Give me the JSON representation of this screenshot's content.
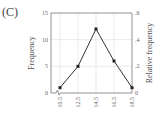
{
  "panel_label": "(C)",
  "chart_data": {
    "type": "line",
    "title": "",
    "xlabel": "",
    "ylabel": "Frequency",
    "ylabel_right": "Relative frequency",
    "x": [
      10.5,
      12.5,
      14.5,
      16.5,
      18.5
    ],
    "x_tick_labels": [
      "10.5",
      "12.5",
      "14.5",
      "16.5",
      "18.5"
    ],
    "values": [
      1,
      5,
      12,
      6,
      1
    ],
    "ylim": [
      0,
      15
    ],
    "y_ticks": [
      0,
      5,
      10,
      15
    ],
    "y_tick_labels": [
      "0",
      "5",
      "10",
      "15"
    ],
    "ylim_right": [
      0,
      0.6
    ],
    "y_right_tick_labels": [
      "0",
      ".2",
      ".4",
      ".6"
    ],
    "grid": true,
    "markers": "square",
    "axis_break": true,
    "colors": {
      "line": "#333333",
      "grid": "#dddddd",
      "axis": "#777777"
    }
  }
}
